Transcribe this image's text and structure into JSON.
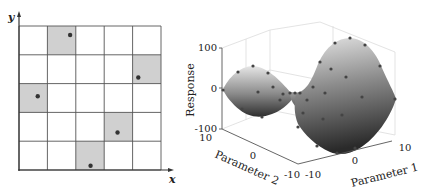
{
  "left_panel": {
    "type": "latin-hypercube-grid",
    "grid_size": 5,
    "axis_labels": {
      "x": "x",
      "y": "y"
    },
    "colors": {
      "grid_line": "#555555",
      "cell_fill": "#d0d0d0",
      "point": "#333333",
      "axis": "#333333"
    },
    "samples": [
      {
        "col": 1,
        "row": 4,
        "x": 1.8,
        "y": 4.69
      },
      {
        "col": 4,
        "row": 3,
        "x": 4.2,
        "y": 3.21
      },
      {
        "col": 0,
        "row": 2,
        "x": 0.66,
        "y": 2.56
      },
      {
        "col": 3,
        "row": 1,
        "x": 3.47,
        "y": 1.3
      },
      {
        "col": 2,
        "row": 0,
        "x": 2.52,
        "y": 0.15
      }
    ]
  },
  "right_panel": {
    "type": "3d-surface",
    "zlabel": "Response",
    "xlabel": "Parameter 1",
    "ylabel": "Parameter 2",
    "z_ticks": [
      "100",
      "0",
      "-100"
    ],
    "p1_ticks": [
      "-10",
      "0",
      "10"
    ],
    "p2_ticks": [
      "10",
      "0",
      "-10"
    ],
    "colors": {
      "point": "#444444",
      "surface_light": "#d8d8d8",
      "surface_dark": "#3a3a3a",
      "box": "#dddddd"
    }
  }
}
